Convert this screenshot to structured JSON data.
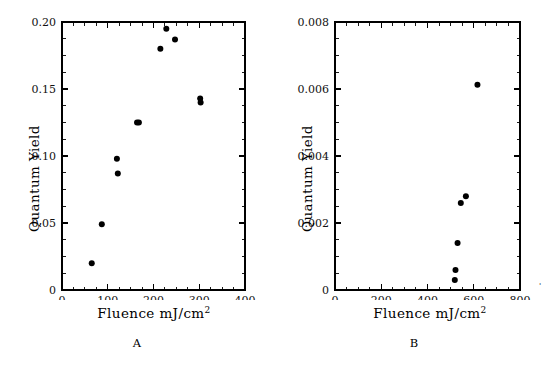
{
  "figure": {
    "background_color": "#ffffff",
    "marker_color": "#000000",
    "axis_color": "#000000"
  },
  "panels": [
    {
      "id": "A",
      "label": "A",
      "xlabel_prefix": "Fluence mJ/cm",
      "xlabel_exponent": "2",
      "ylabel": "Quantum Yield",
      "xticks": [
        "0",
        "100",
        "200",
        "300",
        "400"
      ],
      "yticks": [
        "0",
        "0.05",
        "0.10",
        "0.15",
        "0.20"
      ],
      "edge_mark": ""
    },
    {
      "id": "B",
      "label": "B",
      "xlabel_prefix": "Fluence mJ/cm",
      "xlabel_exponent": "2",
      "ylabel": "Quantum Yield",
      "xticks": [
        "0",
        "200",
        "400",
        "600",
        "800"
      ],
      "yticks": [
        "0",
        "0.002",
        "0.004",
        "0.006",
        "0.008"
      ],
      "edge_mark": "'"
    }
  ],
  "chart_data": [
    {
      "type": "scatter",
      "panel": "A",
      "title": "A",
      "xlabel": "Fluence mJ/cm2",
      "ylabel": "Quantum Yield",
      "xlim": [
        0,
        400
      ],
      "ylim": [
        0,
        0.2
      ],
      "xticks": [
        0,
        100,
        200,
        300,
        400
      ],
      "yticks": [
        0,
        0.05,
        0.1,
        0.15,
        0.2
      ],
      "x_minor_tick_step": 25,
      "y_minor_tick_step": 0.0125,
      "grid": false,
      "legend": null,
      "series": [
        {
          "name": "Quantum Yield vs Fluence",
          "x": [
            65,
            87,
            120,
            122,
            164,
            168,
            215,
            228,
            247,
            302,
            303
          ],
          "y": [
            0.02,
            0.049,
            0.098,
            0.087,
            0.125,
            0.125,
            0.18,
            0.195,
            0.187,
            0.143,
            0.14
          ]
        }
      ]
    },
    {
      "type": "scatter",
      "panel": "B",
      "title": "B",
      "xlabel": "Fluence mJ/cm2",
      "ylabel": "Quantum Yield",
      "xlim": [
        0,
        800
      ],
      "ylim": [
        0,
        0.008
      ],
      "xticks": [
        0,
        200,
        400,
        600,
        800
      ],
      "yticks": [
        0,
        0.002,
        0.004,
        0.006,
        0.008
      ],
      "x_minor_tick_step": 50,
      "y_minor_tick_step": 0.0005,
      "grid": false,
      "legend": null,
      "series": [
        {
          "name": "Quantum Yield vs Fluence",
          "x": [
            518,
            521,
            530,
            544,
            566,
            616
          ],
          "y": [
            0.0003,
            0.0006,
            0.0014,
            0.0026,
            0.0028,
            0.00613
          ]
        }
      ]
    }
  ]
}
